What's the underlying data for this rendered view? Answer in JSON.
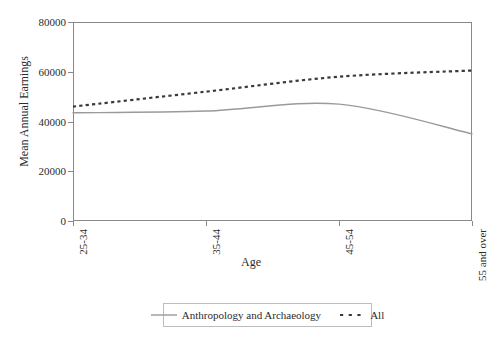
{
  "chart_data": {
    "type": "line",
    "title": "",
    "xlabel": "Age",
    "ylabel": "Mean Annual Earnings",
    "categories": [
      "25-34",
      "35-44",
      "45-54",
      "55 and over"
    ],
    "ylim": [
      0,
      80000
    ],
    "y_ticks": [
      0,
      20000,
      40000,
      60000,
      80000
    ],
    "y_tick_labels": [
      "0",
      "20000",
      "40000",
      "60000",
      "80000"
    ],
    "grid": false,
    "legend_position": "bottom",
    "series": [
      {
        "name": "Anthropology and Archaeology",
        "style": "solid",
        "color": "#9a9a9a",
        "values": [
          43500,
          44200,
          47000,
          35000
        ]
      },
      {
        "name": "All",
        "style": "dashed",
        "color": "#3a3a3a",
        "values": [
          46000,
          52000,
          58000,
          60500
        ]
      }
    ]
  },
  "axes": {
    "y_title": "Mean Annual Earnings",
    "x_title": "Age",
    "y_tick_labels": [
      "80000",
      "60000",
      "40000",
      "20000",
      "0"
    ],
    "x_tick_labels": [
      "25-34",
      "35-44",
      "45-54",
      "55 and over"
    ]
  },
  "legend": {
    "entries": [
      {
        "label": "Anthropology and Archaeology",
        "style": "solid"
      },
      {
        "label": "All",
        "style": "dashed"
      }
    ]
  },
  "colors": {
    "frame": "#8a8a8a",
    "series_solid": "#9a9a9a",
    "series_dashed": "#3a3a3a",
    "text": "#2b2b2b",
    "background": "#ffffff"
  }
}
